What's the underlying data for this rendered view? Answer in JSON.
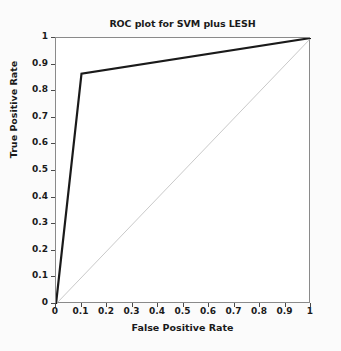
{
  "chart_data": {
    "type": "line",
    "title": "ROC plot for SVM plus LESH",
    "xlabel": "False Positive Rate",
    "ylabel": "True Positive Rate",
    "xlim": [
      0,
      1
    ],
    "ylim": [
      0,
      1
    ],
    "grid": false,
    "legend": "none",
    "xticks": [
      0,
      0.1,
      0.2,
      0.3,
      0.4,
      0.5,
      0.6,
      0.7,
      0.8,
      0.9,
      1
    ],
    "yticks": [
      0,
      0.1,
      0.2,
      0.3,
      0.4,
      0.5,
      0.6,
      0.7,
      0.8,
      0.9,
      1
    ],
    "xticklabels": [
      "0",
      "0.1",
      "0.2",
      "0.3",
      "0.4",
      "0.5",
      "0.6",
      "0.7",
      "0.8",
      "0.9",
      "1"
    ],
    "yticklabels": [
      "0",
      "0.1",
      "0.2",
      "0.3",
      "0.4",
      "0.5",
      "0.6",
      "0.7",
      "0.8",
      "0.9",
      "1"
    ],
    "series": [
      {
        "name": "ROC curve (SVM plus LESH)",
        "color": "#1a1a1a",
        "linewidth": 2.2,
        "x": [
          0,
          0.1,
          1
        ],
        "y": [
          0,
          0.866,
          1
        ]
      },
      {
        "name": "chance diagonal",
        "color": "#c9c9c9",
        "linewidth": 1,
        "x": [
          0,
          1
        ],
        "y": [
          0,
          1
        ]
      }
    ]
  }
}
